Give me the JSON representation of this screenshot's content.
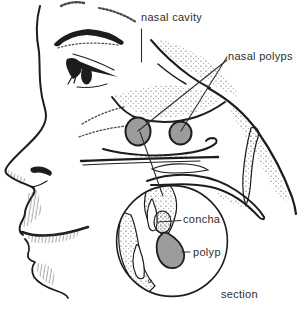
{
  "figure": {
    "type": "medical illustration",
    "labels": {
      "nasal_cavity": "nasal cavity",
      "nasal_polyps": "nasal polyps",
      "concha": "concha",
      "polyp": "polyp",
      "section": "section"
    },
    "colors": {
      "outline": "#1d1d1d",
      "polyp_fill": "#9c9c9c",
      "stipple": "#6e6e6e",
      "label_text": "#2e2e2e",
      "background": "#ffffff"
    }
  }
}
